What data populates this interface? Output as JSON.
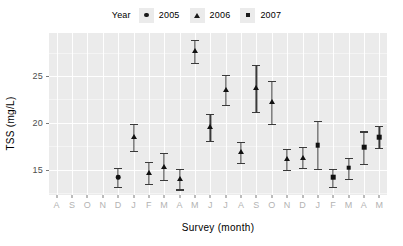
{
  "chart_data": {
    "type": "scatter",
    "title": "",
    "xlabel": "Survey (month)",
    "ylabel": "TSS (mg/L)",
    "legend_title": "Year",
    "legend_position": "top",
    "grid": true,
    "ylim": [
      12.3,
      29.6
    ],
    "yticks": [
      15,
      20,
      25
    ],
    "ytick_labels": [
      "15",
      "20",
      "25"
    ],
    "categories": [
      "A",
      "S",
      "O",
      "N",
      "D",
      "J",
      "F",
      "M",
      "A",
      "M",
      "J",
      "J",
      "A",
      "S",
      "O",
      "N",
      "D",
      "J",
      "F",
      "M",
      "A",
      "M"
    ],
    "series": [
      {
        "name": "2005",
        "marker": "circle",
        "points": [
          {
            "x": "D",
            "index": 4,
            "y": 14.2,
            "lower": 13.2,
            "upper": 15.2
          }
        ]
      },
      {
        "name": "2006",
        "marker": "triangle",
        "points": [
          {
            "x": "J",
            "index": 5,
            "y": 18.5,
            "lower": 17.0,
            "upper": 19.9
          },
          {
            "x": "F",
            "index": 6,
            "y": 14.7,
            "lower": 13.5,
            "upper": 15.8
          },
          {
            "x": "M",
            "index": 7,
            "y": 15.3,
            "lower": 13.9,
            "upper": 16.8
          },
          {
            "x": "A",
            "index": 8,
            "y": 14.0,
            "lower": 12.9,
            "upper": 15.1
          },
          {
            "x": "M",
            "index": 9,
            "y": 27.7,
            "lower": 26.4,
            "upper": 28.9
          },
          {
            "x": "J",
            "index": 10,
            "y": 19.6,
            "lower": 18.1,
            "upper": 21.0
          },
          {
            "x": "J",
            "index": 11,
            "y": 23.5,
            "lower": 21.9,
            "upper": 25.1
          },
          {
            "x": "A",
            "index": 12,
            "y": 16.9,
            "lower": 15.7,
            "upper": 18.0
          },
          {
            "x": "S",
            "index": 13,
            "y": 23.7,
            "lower": 21.2,
            "upper": 26.2
          },
          {
            "x": "O",
            "index": 14,
            "y": 22.2,
            "lower": 19.9,
            "upper": 24.5
          },
          {
            "x": "N",
            "index": 15,
            "y": 16.1,
            "lower": 15.0,
            "upper": 17.2
          },
          {
            "x": "D",
            "index": 16,
            "y": 16.3,
            "lower": 15.2,
            "upper": 17.4
          }
        ]
      },
      {
        "name": "2007",
        "marker": "square",
        "points": [
          {
            "x": "J",
            "index": 17,
            "y": 17.6,
            "lower": 15.1,
            "upper": 20.2
          },
          {
            "x": "F",
            "index": 18,
            "y": 14.2,
            "lower": 13.2,
            "upper": 15.1
          },
          {
            "x": "M",
            "index": 19,
            "y": 15.2,
            "lower": 14.0,
            "upper": 16.3
          },
          {
            "x": "A",
            "index": 20,
            "y": 17.4,
            "lower": 15.6,
            "upper": 19.1
          },
          {
            "x": "M",
            "index": 21,
            "y": 18.5,
            "lower": 17.3,
            "upper": 19.7
          }
        ]
      }
    ],
    "colors": {
      "panel": "#ebebeb",
      "grid": "#ffffff",
      "marker": "#111111",
      "errorbar": "#3a3a3a",
      "axis_text": "#4d4d4d",
      "x_axis_text": "#b3b3b3",
      "background": "#ffffff"
    }
  }
}
